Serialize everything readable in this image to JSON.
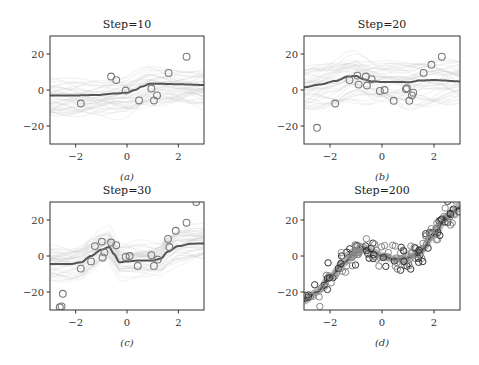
{
  "figure": {
    "width": 479,
    "height": 365
  },
  "chart_data": [
    {
      "type": "line",
      "id": "a",
      "title": "Step=10",
      "caption": "(a)",
      "xlabel": "",
      "ylabel": "",
      "xlim": [
        -3,
        3
      ],
      "ylim": [
        -30,
        30
      ],
      "xticks": [
        -2,
        0,
        2
      ],
      "yticks": [
        -20,
        0,
        20
      ],
      "grid": false,
      "legend": null,
      "frame_px": [
        50,
        36,
        204,
        144
      ],
      "mean_curve": {
        "x": [
          -3,
          -2,
          -1.2,
          -0.5,
          0,
          0.3,
          0.6,
          0.9,
          1.2,
          2,
          3
        ],
        "y": [
          -3,
          -3,
          -2.8,
          -2,
          -1.5,
          0,
          2,
          3.5,
          3.5,
          3.2,
          2.8
        ]
      },
      "band": {
        "spread": 14,
        "samples": 40
      },
      "points": {
        "x": [
          -1.8,
          -0.62,
          -0.42,
          -0.05,
          0.47,
          0.95,
          1.05,
          1.17,
          1.62,
          2.32
        ],
        "y": [
          -7.5,
          7.5,
          5.5,
          -0.3,
          -5.8,
          0.8,
          -5.8,
          -3,
          9.5,
          18.5
        ]
      }
    },
    {
      "type": "line",
      "id": "b",
      "title": "Step=20",
      "caption": "(b)",
      "xlabel": "",
      "ylabel": "",
      "xlim": [
        -3,
        3
      ],
      "ylim": [
        -30,
        30
      ],
      "xticks": [
        -2,
        0,
        2
      ],
      "yticks": [
        -20,
        0,
        20
      ],
      "grid": false,
      "legend": null,
      "frame_px": [
        304,
        36,
        460,
        144
      ],
      "mean_curve": {
        "x": [
          -3,
          -2.4,
          -1.8,
          -1.3,
          -1.0,
          -0.7,
          -0.4,
          0,
          0.6,
          1.0,
          1.5,
          2,
          3
        ],
        "y": [
          1.5,
          3,
          5,
          7.5,
          7.8,
          6,
          4.8,
          4.5,
          4.5,
          4.3,
          5.3,
          5.5,
          4.8
        ]
      },
      "band": {
        "spread": 16,
        "samples": 40
      },
      "points": {
        "x": [
          -2.5,
          -1.8,
          -1.25,
          -0.95,
          -0.9,
          -0.62,
          -0.58,
          -0.4,
          -0.08,
          0.1,
          0.45,
          0.92,
          0.96,
          1.05,
          1.15,
          1.2,
          1.6,
          1.9,
          2.3
        ],
        "y": [
          -21,
          -7.5,
          5.5,
          8,
          3,
          7.5,
          2.5,
          6,
          -0.5,
          0,
          -6,
          0.5,
          1,
          -6,
          -3,
          -1.5,
          9.5,
          14,
          18.5
        ]
      }
    },
    {
      "type": "line",
      "id": "c",
      "title": "Step=30",
      "caption": "(c)",
      "xlabel": "",
      "ylabel": "",
      "xlim": [
        -3,
        3
      ],
      "ylim": [
        -30,
        30
      ],
      "xticks": [
        -2,
        0,
        2
      ],
      "yticks": [
        -20,
        0,
        20
      ],
      "grid": false,
      "legend": null,
      "frame_px": [
        50,
        202,
        204,
        310
      ],
      "mean_curve": {
        "x": [
          -3,
          -2.2,
          -1.8,
          -1.4,
          -1.0,
          -0.7,
          -0.5,
          -0.3,
          0,
          0.5,
          1.0,
          1.3,
          1.6,
          2.0,
          2.5,
          3
        ],
        "y": [
          -4.5,
          -4.5,
          -3.5,
          0,
          3.5,
          5,
          1,
          -3.5,
          -3,
          -2.5,
          -2.5,
          -1.5,
          2.5,
          5.5,
          6.8,
          7
        ]
      },
      "band": {
        "spread": 12,
        "samples": 40
      },
      "points": {
        "x": [
          -2.62,
          -2.55,
          -2.5,
          -1.8,
          -1.4,
          -1.25,
          -0.98,
          -0.95,
          -0.88,
          -0.62,
          -0.42,
          -0.05,
          0.1,
          0.42,
          0.95,
          1.05,
          1.2,
          1.6,
          1.65,
          1.9,
          2.32,
          2.7
        ],
        "y": [
          -28.5,
          -28,
          -21,
          -7,
          -3,
          5.5,
          8,
          -0.8,
          2,
          7.5,
          6,
          -0.5,
          0,
          -5.5,
          0.5,
          -5.5,
          -2,
          9.5,
          5,
          14,
          18.5,
          30
        ]
      }
    },
    {
      "type": "line",
      "id": "d",
      "title": "Step=200",
      "caption": "(d)",
      "xlabel": "",
      "ylabel": "",
      "xlim": [
        -3,
        3
      ],
      "ylim": [
        -30,
        30
      ],
      "xticks": [
        -2,
        0,
        2
      ],
      "yticks": [
        -20,
        0,
        20
      ],
      "grid": false,
      "legend": null,
      "frame_px": [
        304,
        202,
        460,
        310
      ],
      "mean_curve": {
        "x": [
          -3,
          -2.5,
          -2,
          -1.5,
          -1.0,
          -0.6,
          -0.3,
          0,
          0.5,
          1.0,
          1.5,
          2.0,
          2.5,
          3
        ],
        "y": [
          -25,
          -20,
          -12,
          -4,
          2,
          4,
          2,
          0,
          -2,
          -1,
          3,
          12,
          22,
          27
        ]
      },
      "band": {
        "spread": 3,
        "samples": 30
      },
      "points": {
        "generator": "x^3 - 3x cubic trend plus noise",
        "count": 160,
        "noise": 4.5
      }
    }
  ]
}
